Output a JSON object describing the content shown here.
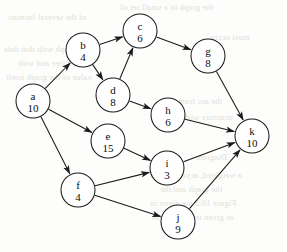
{
  "diagram": {
    "type": "node-link-diagram",
    "node_radius": 17,
    "stroke_color": "#1a1a1a",
    "node_fill": "#ffffff",
    "background_color": "#fdfdfb",
    "nodes": [
      {
        "id": "a",
        "label": "a",
        "weight": "10",
        "cx": 33,
        "cy": 101
      },
      {
        "id": "b",
        "label": "b",
        "weight": "4",
        "cx": 83,
        "cy": 50
      },
      {
        "id": "c",
        "label": "c",
        "weight": "6",
        "cx": 140,
        "cy": 31
      },
      {
        "id": "d",
        "label": "d",
        "weight": "8",
        "cx": 113,
        "cy": 95
      },
      {
        "id": "e",
        "label": "e",
        "weight": "15",
        "cx": 108,
        "cy": 141
      },
      {
        "id": "f",
        "label": "f",
        "weight": "4",
        "cx": 78,
        "cy": 190
      },
      {
        "id": "g",
        "label": "g",
        "weight": "8",
        "cx": 208,
        "cy": 56
      },
      {
        "id": "h",
        "label": "h",
        "weight": "6",
        "cx": 168,
        "cy": 115
      },
      {
        "id": "i",
        "label": "i",
        "weight": "3",
        "cx": 167,
        "cy": 168
      },
      {
        "id": "j",
        "label": "j",
        "weight": "9",
        "cx": 178,
        "cy": 222
      },
      {
        "id": "k",
        "label": "k",
        "weight": "10",
        "cx": 252,
        "cy": 136
      }
    ],
    "edges": [
      {
        "from": "a",
        "to": "b"
      },
      {
        "from": "a",
        "to": "e"
      },
      {
        "from": "a",
        "to": "f"
      },
      {
        "from": "b",
        "to": "c"
      },
      {
        "from": "b",
        "to": "d"
      },
      {
        "from": "d",
        "to": "c"
      },
      {
        "from": "d",
        "to": "h"
      },
      {
        "from": "c",
        "to": "g"
      },
      {
        "from": "e",
        "to": "i"
      },
      {
        "from": "f",
        "to": "i"
      },
      {
        "from": "f",
        "to": "j"
      },
      {
        "from": "g",
        "to": "k"
      },
      {
        "from": "h",
        "to": "k"
      },
      {
        "from": "i",
        "to": "k"
      },
      {
        "from": "j",
        "to": "k"
      }
    ]
  },
  "background_bleed": {
    "note": "faint mirrored show-through text from reverse of page",
    "lines": [
      {
        "text": "the graph in a small set of",
        "x": 120,
        "y": 2
      },
      {
        "text": "of the several formats",
        "x": 8,
        "y": 12
      },
      {
        "text": "most occur",
        "x": 210,
        "y": 32
      },
      {
        "text": "a graph with that data",
        "x": 4,
        "y": 44
      },
      {
        "text": "in a tree and with",
        "x": 18,
        "y": 58
      },
      {
        "text": "value of the graph itself",
        "x": 6,
        "y": 72
      },
      {
        "text": "the arc from",
        "x": 178,
        "y": 96
      },
      {
        "text": "structure with the",
        "x": 170,
        "y": 112
      },
      {
        "text": "Diagram",
        "x": 196,
        "y": 152
      },
      {
        "text": "a weighted, acyclic graph",
        "x": 150,
        "y": 170
      },
      {
        "text": "the graph and the",
        "x": 160,
        "y": 184
      },
      {
        "text": "Figure 10.2 are given in",
        "x": 150,
        "y": 198
      },
      {
        "text": "as given in the Section",
        "x": 152,
        "y": 212
      }
    ]
  }
}
